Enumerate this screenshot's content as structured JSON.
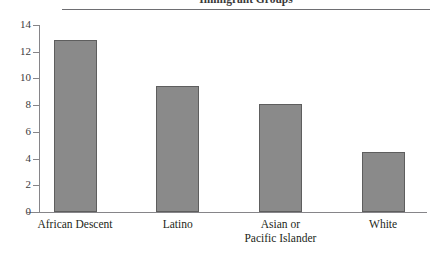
{
  "chart_data": {
    "type": "bar",
    "title": "Immigrant Groups",
    "xlabel": "",
    "ylabel": "",
    "categories": [
      "African Descent",
      "Latino",
      "Asian or\nPacific Islander",
      "White"
    ],
    "values": [
      12.9,
      9.4,
      8.1,
      4.5
    ],
    "ylim": [
      0,
      14
    ],
    "yticks": [
      0,
      2,
      4,
      6,
      8,
      10,
      12,
      14
    ],
    "ytick_labels": [
      "0",
      "2",
      "4",
      "6",
      "8",
      "10",
      "12",
      "14"
    ],
    "grid": false,
    "legend": null,
    "bar_color": "#8a8a8a",
    "bar_edge_color": "#5e5e5e",
    "axis_color": "#868589",
    "text_color": "#231f20"
  }
}
